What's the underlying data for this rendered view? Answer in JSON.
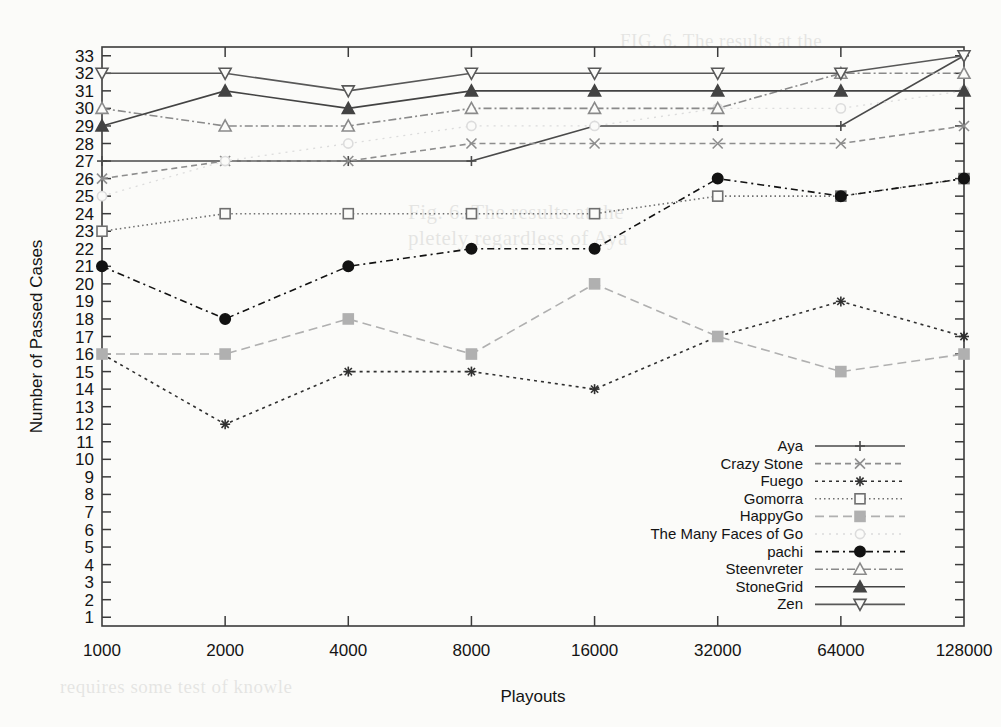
{
  "chart_data": {
    "type": "line",
    "title": "",
    "xlabel": "Playouts",
    "ylabel": "Number of Passed Cases",
    "x": [
      1000,
      2000,
      4000,
      8000,
      16000,
      32000,
      64000,
      128000
    ],
    "xtick_labels": [
      "1000",
      "2000",
      "4000",
      "8000",
      "16000",
      "32000",
      "64000",
      "128000"
    ],
    "xscale": "log2",
    "ylim": [
      0.5,
      33.5
    ],
    "ytick_labels": [
      "1",
      "2",
      "3",
      "4",
      "5",
      "6",
      "7",
      "8",
      "9",
      "10",
      "11",
      "12",
      "13",
      "14",
      "15",
      "16",
      "17",
      "18",
      "19",
      "20",
      "21",
      "22",
      "23",
      "24",
      "25",
      "26",
      "27",
      "28",
      "29",
      "30",
      "31",
      "32",
      "33"
    ],
    "grid": false,
    "legend_position": "bottom-right inside plot",
    "series": [
      {
        "name": "Aya",
        "values": [
          27,
          27,
          27,
          27,
          29,
          29,
          29,
          33
        ],
        "color": "#4a4a4a",
        "dash": "none",
        "marker": "plus",
        "legend_key": "legend-aya"
      },
      {
        "name": "Crazy Stone",
        "values": [
          26,
          27,
          27,
          28,
          28,
          28,
          28,
          29
        ],
        "color": "#8d8d8d",
        "dash": "6,4",
        "marker": "cross",
        "legend_key": "legend-crazy-stone"
      },
      {
        "name": "Fuego",
        "values": [
          16,
          12,
          15,
          15,
          14,
          17,
          19,
          17
        ],
        "color": "#303030",
        "dash": "3,4",
        "marker": "star",
        "legend_key": "legend-fuego"
      },
      {
        "name": "Gomorra",
        "values": [
          23,
          24,
          24,
          24,
          24,
          25,
          25,
          26
        ],
        "color": "#6f6f6f",
        "dash": "1.5,3",
        "marker": "open-square",
        "legend_key": "legend-gomorra"
      },
      {
        "name": "HappyGo",
        "values": [
          16,
          16,
          18,
          16,
          20,
          17,
          15,
          16
        ],
        "color": "#b0b0b0",
        "dash": "9,5",
        "marker": "filled-square",
        "legend_key": "legend-happygo"
      },
      {
        "name": "The Many Faces of Go",
        "values": [
          25,
          27,
          28,
          29,
          29,
          30,
          30,
          31
        ],
        "color": "#dcdcdc",
        "dash": "2,5",
        "marker": "open-circle",
        "legend_key": "legend-many-faces"
      },
      {
        "name": "pachi",
        "values": [
          21,
          18,
          21,
          22,
          22,
          26,
          25,
          26
        ],
        "color": "#121212",
        "dash": "7,4,2,4",
        "marker": "filled-circle",
        "legend_key": "legend-pachi"
      },
      {
        "name": "Steenvreter",
        "values": [
          30,
          29,
          29,
          30,
          30,
          30,
          32,
          32
        ],
        "color": "#8a8a8a",
        "dash": "8,3,2,3",
        "marker": "open-triangle-up",
        "legend_key": "legend-steenvreter"
      },
      {
        "name": "StoneGrid",
        "values": [
          29,
          31,
          30,
          31,
          31,
          31,
          31,
          31
        ],
        "color": "#434343",
        "dash": "none",
        "marker": "filled-triangle-up",
        "legend_key": "legend-stonegrid"
      },
      {
        "name": "Zen",
        "values": [
          32,
          32,
          31,
          32,
          32,
          32,
          32,
          33
        ],
        "color": "#585858",
        "dash": "none",
        "marker": "open-triangle-down",
        "legend_key": "legend-zen"
      }
    ]
  },
  "axes": {
    "x_title": "Playouts",
    "y_title": "Number of Passed Cases"
  },
  "legend": {
    "entries": [
      {
        "label": "Aya"
      },
      {
        "label": "Crazy Stone"
      },
      {
        "label": "Fuego"
      },
      {
        "label": "Gomorra"
      },
      {
        "label": "HappyGo"
      },
      {
        "label": "The Many Faces of Go"
      },
      {
        "label": "pachi"
      },
      {
        "label": "Steenvreter"
      },
      {
        "label": "StoneGrid"
      },
      {
        "label": "Zen"
      }
    ]
  },
  "ghost_text": {
    "line1": "Fig. 6.  The results at the",
    "line2": "pletely regardless of Aya",
    "line3": "FIG. 6.  The results at the",
    "line4": "requires some test of knowle"
  }
}
